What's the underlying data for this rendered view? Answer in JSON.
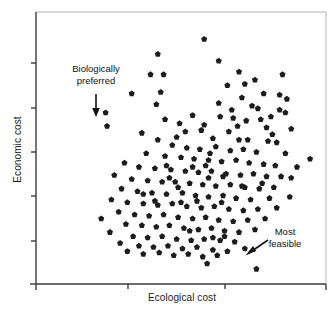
{
  "figure": {
    "background_color": "#ffffff",
    "frame_color": "#b4b4b4",
    "axis_color": "#3a3a3a",
    "marker_color": "#1c1c1c"
  },
  "annotations": {
    "biologically_preferred": {
      "line1": "Biologically",
      "line2": "preferred",
      "arrow": "arrow-down"
    },
    "most_feasible": {
      "line1": "Most",
      "line2": "feasible",
      "arrow": "arrow-down-left"
    }
  },
  "chart_data": {
    "type": "scatter",
    "title": "",
    "xlabel": "Ecological cost",
    "ylabel": "Economic cost",
    "xlim": [
      0,
      100
    ],
    "ylim": [
      0,
      100
    ],
    "grid": false,
    "legend": null,
    "x_tick_labels": [],
    "y_tick_labels": [],
    "x_ticks": [
      0,
      30,
      62,
      100
    ],
    "y_ticks": [
      0,
      16,
      34,
      50,
      66,
      84
    ],
    "marker": "pentagon",
    "marker_size": 4,
    "series": [
      {
        "name": "solutions",
        "points": [
          [
            24.5,
            58.0
          ],
          [
            58.0,
            90.0
          ],
          [
            42.0,
            84.5
          ],
          [
            63.0,
            82.0
          ],
          [
            70.0,
            78.0
          ],
          [
            39.5,
            77.0
          ],
          [
            44.0,
            77.0
          ],
          [
            85.0,
            77.0
          ],
          [
            66.0,
            73.0
          ],
          [
            33.0,
            70.0
          ],
          [
            43.0,
            70.5
          ],
          [
            78.5,
            70.0
          ],
          [
            84.0,
            69.5
          ],
          [
            86.5,
            68.0
          ],
          [
            41.5,
            66.0
          ],
          [
            71.0,
            68.5
          ],
          [
            74.5,
            65.5
          ],
          [
            76.5,
            64.5
          ],
          [
            84.0,
            64.0
          ],
          [
            86.0,
            63.0
          ],
          [
            24.0,
            63.0
          ],
          [
            54.0,
            62.0
          ],
          [
            63.5,
            61.5
          ],
          [
            68.0,
            61.0
          ],
          [
            72.5,
            60.0
          ],
          [
            58.0,
            58.5
          ],
          [
            57.0,
            56.5
          ],
          [
            66.5,
            56.0
          ],
          [
            79.5,
            57.5
          ],
          [
            81.5,
            55.0
          ],
          [
            48.5,
            54.0
          ],
          [
            61.0,
            53.5
          ],
          [
            70.0,
            53.0
          ],
          [
            73.0,
            53.0
          ],
          [
            80.0,
            52.5
          ],
          [
            83.0,
            52.0
          ],
          [
            52.0,
            50.0
          ],
          [
            56.5,
            49.5
          ],
          [
            62.0,
            50.5
          ],
          [
            67.0,
            49.0
          ],
          [
            71.5,
            49.5
          ],
          [
            76.0,
            48.5
          ],
          [
            86.0,
            48.0
          ],
          [
            38.0,
            48.0
          ],
          [
            44.5,
            47.0
          ],
          [
            50.0,
            46.5
          ],
          [
            54.5,
            46.0
          ],
          [
            59.5,
            45.5
          ],
          [
            64.0,
            45.0
          ],
          [
            69.0,
            45.5
          ],
          [
            73.5,
            44.5
          ],
          [
            78.5,
            44.0
          ],
          [
            82.5,
            43.5
          ],
          [
            94.5,
            46.0
          ],
          [
            30.5,
            44.5
          ],
          [
            35.5,
            43.0
          ],
          [
            41.0,
            42.5
          ],
          [
            46.5,
            42.0
          ],
          [
            51.5,
            41.5
          ],
          [
            56.0,
            41.0
          ],
          [
            60.5,
            41.5
          ],
          [
            65.5,
            40.5
          ],
          [
            70.5,
            40.0
          ],
          [
            75.0,
            40.5
          ],
          [
            79.5,
            39.5
          ],
          [
            88.0,
            39.0
          ],
          [
            27.0,
            40.0
          ],
          [
            33.0,
            38.5
          ],
          [
            38.5,
            38.0
          ],
          [
            43.5,
            37.5
          ],
          [
            48.0,
            37.5
          ],
          [
            53.0,
            37.0
          ],
          [
            57.5,
            36.5
          ],
          [
            62.0,
            36.0
          ],
          [
            67.0,
            36.5
          ],
          [
            72.0,
            35.5
          ],
          [
            77.0,
            35.0
          ],
          [
            82.0,
            35.5
          ],
          [
            29.5,
            35.0
          ],
          [
            35.0,
            34.0
          ],
          [
            40.0,
            33.5
          ],
          [
            45.0,
            33.0
          ],
          [
            50.5,
            33.5
          ],
          [
            55.0,
            32.5
          ],
          [
            59.5,
            32.0
          ],
          [
            64.5,
            32.5
          ],
          [
            69.0,
            31.5
          ],
          [
            74.0,
            31.0
          ],
          [
            80.5,
            31.5
          ],
          [
            87.5,
            32.0
          ],
          [
            26.0,
            31.0
          ],
          [
            31.5,
            30.0
          ],
          [
            37.0,
            29.5
          ],
          [
            42.0,
            29.0
          ],
          [
            47.0,
            29.5
          ],
          [
            52.0,
            28.5
          ],
          [
            57.0,
            28.0
          ],
          [
            61.5,
            28.5
          ],
          [
            66.5,
            27.5
          ],
          [
            71.5,
            27.0
          ],
          [
            76.5,
            27.5
          ],
          [
            83.0,
            28.0
          ],
          [
            28.5,
            26.5
          ],
          [
            34.0,
            25.5
          ],
          [
            39.0,
            25.0
          ],
          [
            44.0,
            25.5
          ],
          [
            49.0,
            24.5
          ],
          [
            54.0,
            24.0
          ],
          [
            58.5,
            24.5
          ],
          [
            63.0,
            23.5
          ],
          [
            68.0,
            23.0
          ],
          [
            73.0,
            23.5
          ],
          [
            79.0,
            24.0
          ],
          [
            22.5,
            24.0
          ],
          [
            31.0,
            22.0
          ],
          [
            36.5,
            21.5
          ],
          [
            41.5,
            21.0
          ],
          [
            46.0,
            21.5
          ],
          [
            51.0,
            20.5
          ],
          [
            56.0,
            20.0
          ],
          [
            60.5,
            20.5
          ],
          [
            65.0,
            19.5
          ],
          [
            70.0,
            19.0
          ],
          [
            75.5,
            20.0
          ],
          [
            25.5,
            19.0
          ],
          [
            33.5,
            17.5
          ],
          [
            38.5,
            17.0
          ],
          [
            43.5,
            17.5
          ],
          [
            48.5,
            16.5
          ],
          [
            53.5,
            16.0
          ],
          [
            58.0,
            16.5
          ],
          [
            63.5,
            16.0
          ],
          [
            68.5,
            15.5
          ],
          [
            29.0,
            15.0
          ],
          [
            35.5,
            14.0
          ],
          [
            40.5,
            13.5
          ],
          [
            45.5,
            14.0
          ],
          [
            50.5,
            13.0
          ],
          [
            55.5,
            13.5
          ],
          [
            61.0,
            12.5
          ],
          [
            66.0,
            12.0
          ],
          [
            72.0,
            13.0
          ],
          [
            31.5,
            12.0
          ],
          [
            37.0,
            11.0
          ],
          [
            42.5,
            11.5
          ],
          [
            47.5,
            10.5
          ],
          [
            52.5,
            11.0
          ],
          [
            57.5,
            10.0
          ],
          [
            62.5,
            10.5
          ],
          [
            59.0,
            7.5
          ],
          [
            61.0,
            17.0
          ],
          [
            65.0,
            17.5
          ],
          [
            54.0,
            43.0
          ],
          [
            58.5,
            43.5
          ],
          [
            51.5,
            56.0
          ],
          [
            47.0,
            51.0
          ],
          [
            60.0,
            48.0
          ],
          [
            77.5,
            60.5
          ],
          [
            81.0,
            61.5
          ],
          [
            69.5,
            58.0
          ],
          [
            44.5,
            60.5
          ],
          [
            49.5,
            59.0
          ],
          [
            63.0,
            66.5
          ],
          [
            67.5,
            64.0
          ],
          [
            72.0,
            73.5
          ],
          [
            75.5,
            75.0
          ],
          [
            88.0,
            57.0
          ],
          [
            90.0,
            43.0
          ],
          [
            36.5,
            55.5
          ],
          [
            42.0,
            53.0
          ],
          [
            46.0,
            39.0
          ],
          [
            50.0,
            30.0
          ],
          [
            55.5,
            30.5
          ],
          [
            64.0,
            30.0
          ],
          [
            71.0,
            36.0
          ],
          [
            78.0,
            37.0
          ],
          [
            84.5,
            39.5
          ],
          [
            59.5,
            39.0
          ],
          [
            64.5,
            39.5
          ],
          [
            53.0,
            19.5
          ],
          [
            49.0,
            35.5
          ],
          [
            41.0,
            30.5
          ],
          [
            37.0,
            33.0
          ],
          [
            45.0,
            43.5
          ],
          [
            76.0,
            5.5
          ]
        ]
      }
    ],
    "highlighted_points": [
      {
        "name": "biologically-preferred-point",
        "x": 24.5,
        "y": 58.0
      },
      {
        "name": "most-feasible-point",
        "x": 76.0,
        "y": 5.5
      }
    ]
  }
}
